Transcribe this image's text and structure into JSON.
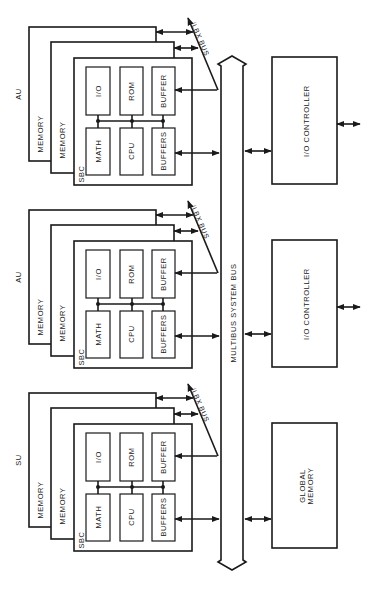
{
  "diagram": {
    "bus_label": "MULTIBUS SYSTEM BUS",
    "units": [
      {
        "label": "AU",
        "memory_labels": [
          "MEMORY",
          "MEMORY"
        ],
        "sbc_label": "SBC",
        "local_bus_label": "iLBX BUS",
        "top_row": [
          "I/O",
          "ROM",
          "BUFFER"
        ],
        "bottom_row": [
          "MATH",
          "CPU",
          "BUFFERS"
        ],
        "peripheral": "I/O CONTROLLER"
      },
      {
        "label": "AU",
        "memory_labels": [
          "MEMORY",
          "MEMORY"
        ],
        "sbc_label": "SBC",
        "local_bus_label": "iLBX BUS",
        "top_row": [
          "I/O",
          "ROM",
          "BUFFER"
        ],
        "bottom_row": [
          "MATH",
          "CPU",
          "BUFFERS"
        ],
        "peripheral": "I/O CONTROLLER"
      },
      {
        "label": "SU",
        "memory_labels": [
          "MEMORY",
          "MEMORY"
        ],
        "sbc_label": "SBC",
        "local_bus_label": "iLBX BUS",
        "top_row": [
          "I/O",
          "ROM",
          "BUFFER"
        ],
        "bottom_row": [
          "MATH",
          "CPU",
          "BUFFERS"
        ],
        "peripheral_lines": [
          "GLOBAL",
          "MEMORY"
        ]
      }
    ]
  }
}
